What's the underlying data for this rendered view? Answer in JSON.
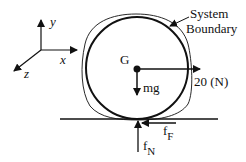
{
  "diagram": {
    "type": "free-body-diagram",
    "axes": {
      "y_label": "y",
      "x_label": "x",
      "z_label": "z"
    },
    "system_boundary_label": [
      "System",
      "Boundary"
    ],
    "center_label": "G",
    "forces": {
      "weight": "mg",
      "applied": "20 (N)",
      "friction": {
        "base": "f",
        "sub": "F"
      },
      "normal": {
        "base": "f",
        "sub": "N"
      }
    },
    "colors": {
      "stroke": "#111111",
      "background": "#ffffff"
    }
  }
}
